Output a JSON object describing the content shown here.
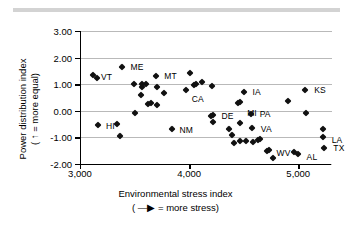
{
  "chart_data": {
    "type": "scatter",
    "title": "",
    "xlabel": "Environmental stress index",
    "xlabel_note": "( —▶ = more stress)",
    "ylabel": "Power distribution index",
    "ylabel_note": "( ↑ = more equal)",
    "xlim": [
      3000,
      5300
    ],
    "ylim": [
      -2.0,
      3.0
    ],
    "xticks": [
      "3,000",
      "4,000",
      "5,000"
    ],
    "xtick_values": [
      3000,
      4000,
      5000
    ],
    "yticks": [
      "3.00",
      "2.00",
      "1.00",
      "0.00",
      "-1.00",
      "-2.00"
    ],
    "ytick_values": [
      3.0,
      2.0,
      1.0,
      0.0,
      -1.0,
      -2.0
    ],
    "grid": "horizontal",
    "legend": "none",
    "marker": "diamond",
    "marker_color": "#111111",
    "grid_color": "#b9b9b9",
    "axis_color": "#000000",
    "points": [
      {
        "x": 3110,
        "y": 1.35,
        "label": "VT",
        "lx": 8,
        "ly": 2
      },
      {
        "x": 3150,
        "y": 1.22,
        "label": "",
        "lx": 0,
        "ly": 0
      },
      {
        "x": 3155,
        "y": -0.55,
        "label": "HI",
        "lx": 8,
        "ly": 1
      },
      {
        "x": 3330,
        "y": -0.48,
        "label": "",
        "lx": 0,
        "ly": 0
      },
      {
        "x": 3355,
        "y": -0.93,
        "label": "",
        "lx": 0,
        "ly": 0
      },
      {
        "x": 3380,
        "y": 1.66,
        "label": "ME",
        "lx": 8,
        "ly": 0
      },
      {
        "x": 3490,
        "y": 1.0,
        "label": "",
        "lx": 0,
        "ly": 0
      },
      {
        "x": 3495,
        "y": -0.08,
        "label": "",
        "lx": 0,
        "ly": 0
      },
      {
        "x": 3560,
        "y": 1.02,
        "label": "",
        "lx": 0,
        "ly": 0
      },
      {
        "x": 3555,
        "y": 0.88,
        "label": "",
        "lx": 0,
        "ly": 0
      },
      {
        "x": 3550,
        "y": 0.6,
        "label": "",
        "lx": 0,
        "ly": 0
      },
      {
        "x": 3600,
        "y": 1.0,
        "label": "",
        "lx": 0,
        "ly": 0
      },
      {
        "x": 3610,
        "y": 0.25,
        "label": "",
        "lx": 0,
        "ly": 0
      },
      {
        "x": 3640,
        "y": 0.3,
        "label": "",
        "lx": 0,
        "ly": 0
      },
      {
        "x": 3690,
        "y": 1.32,
        "label": "MT",
        "lx": 8,
        "ly": 0
      },
      {
        "x": 3700,
        "y": 0.9,
        "label": "",
        "lx": 0,
        "ly": 0
      },
      {
        "x": 3700,
        "y": 0.22,
        "label": "",
        "lx": 0,
        "ly": 0
      },
      {
        "x": 3760,
        "y": 0.67,
        "label": "",
        "lx": 0,
        "ly": 0
      },
      {
        "x": 3830,
        "y": -0.7,
        "label": "NM",
        "lx": 8,
        "ly": 1
      },
      {
        "x": 3960,
        "y": 0.78,
        "label": "CA",
        "lx": 6,
        "ly": 9
      },
      {
        "x": 4000,
        "y": 1.41,
        "label": "",
        "lx": 0,
        "ly": 0
      },
      {
        "x": 4040,
        "y": 0.96,
        "label": "",
        "lx": 0,
        "ly": 0
      },
      {
        "x": 4055,
        "y": 0.99,
        "label": "",
        "lx": 0,
        "ly": 0
      },
      {
        "x": 4110,
        "y": 1.1,
        "label": "",
        "lx": 0,
        "ly": 0
      },
      {
        "x": 4200,
        "y": 0.93,
        "label": "",
        "lx": 0,
        "ly": 0
      },
      {
        "x": 4205,
        "y": -0.15,
        "label": "DE",
        "lx": 9,
        "ly": 1
      },
      {
        "x": 4195,
        "y": -0.18,
        "label": "",
        "lx": 0,
        "ly": 0
      },
      {
        "x": 4205,
        "y": -0.41,
        "label": "",
        "lx": 0,
        "ly": 0
      },
      {
        "x": 4360,
        "y": -0.67,
        "label": "",
        "lx": 0,
        "ly": 0
      },
      {
        "x": 4385,
        "y": -0.9,
        "label": "",
        "lx": 0,
        "ly": 0
      },
      {
        "x": 4400,
        "y": -1.21,
        "label": "",
        "lx": 0,
        "ly": 0
      },
      {
        "x": 4440,
        "y": 0.3,
        "label": "MI",
        "lx": 9,
        "ly": 10
      },
      {
        "x": 4455,
        "y": 0.33,
        "label": "",
        "lx": 0,
        "ly": 0
      },
      {
        "x": 4460,
        "y": -0.47,
        "label": "",
        "lx": 0,
        "ly": 0
      },
      {
        "x": 4455,
        "y": -1.14,
        "label": "",
        "lx": 0,
        "ly": 0
      },
      {
        "x": 4490,
        "y": 0.7,
        "label": "IA",
        "lx": 9,
        "ly": 0
      },
      {
        "x": 4510,
        "y": -1.13,
        "label": "",
        "lx": 0,
        "ly": 0
      },
      {
        "x": 4555,
        "y": -0.11,
        "label": "PA",
        "lx": 9,
        "ly": 0
      },
      {
        "x": 4565,
        "y": -0.65,
        "label": "VA",
        "lx": 9,
        "ly": 1
      },
      {
        "x": 4580,
        "y": -1.19,
        "label": "",
        "lx": 0,
        "ly": 0
      },
      {
        "x": 4625,
        "y": -1.1,
        "label": "",
        "lx": 0,
        "ly": 0
      },
      {
        "x": 4640,
        "y": -1.07,
        "label": "",
        "lx": 0,
        "ly": 0
      },
      {
        "x": 4700,
        "y": -1.5,
        "label": "WV",
        "lx": 10,
        "ly": 2
      },
      {
        "x": 4720,
        "y": -1.47,
        "label": "",
        "lx": 0,
        "ly": 0
      },
      {
        "x": 4760,
        "y": -1.76,
        "label": "",
        "lx": 0,
        "ly": 0
      },
      {
        "x": 4900,
        "y": 0.37,
        "label": "",
        "lx": 0,
        "ly": 0
      },
      {
        "x": 4950,
        "y": -1.56,
        "label": "",
        "lx": 0,
        "ly": 0
      },
      {
        "x": 4985,
        "y": -1.62,
        "label": "AL",
        "lx": 9,
        "ly": 3
      },
      {
        "x": 5055,
        "y": 0.8,
        "label": "KS",
        "lx": 9,
        "ly": 0
      },
      {
        "x": 5060,
        "y": -0.07,
        "label": "",
        "lx": 0,
        "ly": 0
      },
      {
        "x": 5215,
        "y": -0.67,
        "label": "",
        "lx": 0,
        "ly": 0
      },
      {
        "x": 5215,
        "y": -0.97,
        "label": "LA",
        "lx": 9,
        "ly": 3
      },
      {
        "x": 5230,
        "y": -1.4,
        "label": "TX",
        "lx": 9,
        "ly": 0
      }
    ]
  }
}
